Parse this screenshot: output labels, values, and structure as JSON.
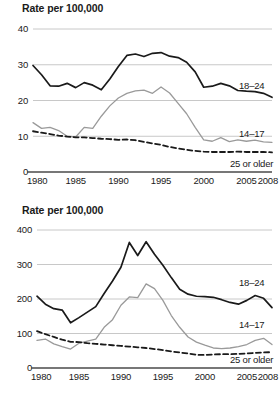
{
  "charts": [
    {
      "id": "top",
      "title": "Rate per 100,000",
      "ylabel_text": "Rate per 100,000",
      "yticks": [
        "40",
        "30",
        "20",
        "10",
        "0"
      ],
      "xticks": [
        "1980",
        "1985",
        "1990",
        "1995",
        "2000",
        "2005",
        "2008"
      ],
      "labels": {
        "s1": "18–24",
        "s2": "14–17",
        "s3": "25 or older"
      }
    },
    {
      "id": "bottom",
      "title": "Rate per 100,000",
      "ylabel_text": "Rate per 100,000",
      "yticks": [
        "400",
        "300",
        "200",
        "100",
        "0"
      ],
      "xticks": [
        "1980",
        "1985",
        "1990",
        "1995",
        "2000",
        "2005",
        "2008"
      ],
      "labels": {
        "s1": "18–24",
        "s2": "14–17",
        "s3": "25 or older"
      }
    }
  ],
  "colors": {
    "series_18_24": "#1a1a1a",
    "series_14_17": "#9a9a9a",
    "series_25_older": "#1a1a1a",
    "gridline": "#c8c8c8",
    "axis": "#4a4a4a",
    "text": "#1a1a1a",
    "background": "#ffffff"
  },
  "chart_data": [
    {
      "type": "line",
      "title": "Rate per 100,000",
      "subtitle": "",
      "xlabel": "",
      "ylabel": "Rate per 100,000",
      "xlim": [
        1980,
        2008
      ],
      "ylim": [
        0,
        40
      ],
      "yticks": [
        0,
        10,
        20,
        30,
        40
      ],
      "xticks": [
        1980,
        1985,
        1990,
        1995,
        2000,
        2005,
        2008
      ],
      "grid": true,
      "legend_position": "inline-right",
      "x": [
        1980,
        1981,
        1982,
        1983,
        1984,
        1985,
        1986,
        1987,
        1988,
        1989,
        1990,
        1991,
        1992,
        1993,
        1994,
        1995,
        1996,
        1997,
        1998,
        1999,
        2000,
        2001,
        2002,
        2003,
        2004,
        2005,
        2006,
        2007,
        2008
      ],
      "series": [
        {
          "name": "18–24",
          "color": "#1a1a1a",
          "style": "solid",
          "values": [
            29.8,
            27.2,
            24.1,
            24.0,
            24.8,
            23.6,
            25.0,
            24.3,
            23.0,
            26.0,
            29.5,
            32.6,
            33.0,
            32.3,
            33.2,
            33.4,
            32.4,
            32.0,
            30.7,
            28.0,
            23.7,
            24.0,
            24.8,
            24.1,
            22.8,
            22.6,
            22.5,
            22.0,
            20.9
          ]
        },
        {
          "name": "14–17",
          "color": "#9a9a9a",
          "style": "solid",
          "values": [
            13.8,
            12.2,
            12.5,
            11.6,
            10.0,
            9.8,
            12.5,
            12.2,
            15.6,
            18.5,
            20.7,
            22.0,
            22.7,
            22.9,
            22.0,
            23.8,
            22.1,
            19.2,
            16.3,
            12.5,
            9.0,
            8.6,
            9.6,
            8.5,
            9.0,
            8.6,
            8.9,
            8.4,
            8.3
          ]
        },
        {
          "name": "25 or older",
          "color": "#1a1a1a",
          "style": "dashed",
          "values": [
            11.4,
            11.0,
            10.6,
            10.2,
            9.9,
            9.7,
            9.7,
            9.5,
            9.3,
            9.2,
            9.0,
            9.1,
            8.9,
            8.4,
            8.0,
            7.6,
            7.0,
            6.6,
            6.2,
            5.9,
            5.7,
            5.6,
            5.6,
            5.6,
            5.7,
            5.6,
            5.6,
            5.6,
            5.5
          ]
        }
      ]
    },
    {
      "type": "line",
      "title": "Rate per 100,000",
      "subtitle": "",
      "xlabel": "",
      "ylabel": "Rate per 100,000",
      "xlim": [
        1980,
        2008
      ],
      "ylim": [
        0,
        400
      ],
      "yticks": [
        0,
        100,
        200,
        300,
        400
      ],
      "xticks": [
        1980,
        1985,
        1990,
        1995,
        2000,
        2005,
        2008
      ],
      "grid": true,
      "legend_position": "inline-right",
      "x": [
        1980,
        1981,
        1982,
        1983,
        1984,
        1985,
        1986,
        1987,
        1988,
        1989,
        1990,
        1991,
        1992,
        1993,
        1994,
        1995,
        1996,
        1997,
        1998,
        1999,
        2000,
        2001,
        2002,
        2003,
        2004,
        2005,
        2006,
        2007,
        2008
      ],
      "series": [
        {
          "name": "18–24",
          "color": "#1a1a1a",
          "style": "solid",
          "values": [
            208,
            185,
            172,
            168,
            131,
            146,
            162,
            178,
            216,
            252,
            292,
            364,
            326,
            366,
            330,
            298,
            262,
            228,
            214,
            208,
            207,
            205,
            198,
            190,
            185,
            196,
            210,
            202,
            175
          ]
        },
        {
          "name": "14–17",
          "color": "#9a9a9a",
          "style": "solid",
          "values": [
            80,
            84,
            70,
            62,
            55,
            72,
            78,
            84,
            118,
            140,
            182,
            206,
            204,
            244,
            230,
            196,
            152,
            118,
            90,
            75,
            66,
            58,
            56,
            58,
            62,
            68,
            80,
            86,
            68
          ]
        },
        {
          "name": "25 or older",
          "color": "#1a1a1a",
          "style": "dashed",
          "values": [
            107,
            98,
            90,
            82,
            76,
            75,
            72,
            70,
            68,
            66,
            64,
            62,
            60,
            58,
            55,
            52,
            48,
            45,
            42,
            38,
            38,
            39,
            40,
            40,
            41,
            42,
            44,
            45,
            46
          ]
        }
      ]
    }
  ]
}
